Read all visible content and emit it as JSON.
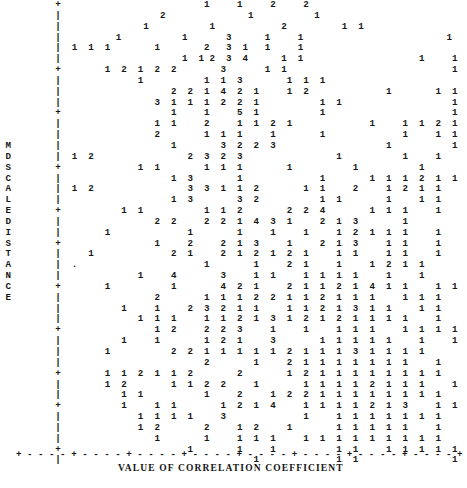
{
  "chart_data": {
    "type": "scatter",
    "title": "",
    "subtitle": "",
    "xlabel": "VALUE OF CORRELATION COEFFICIENT",
    "ylabel": "MDSCALE DISTANCE",
    "grid": false,
    "legend": null,
    "plot_style": "ascii-line-printer",
    "point_glyph_meaning": "digit = number of coincident observations in that character cell",
    "glyph_values_present": [
      "1",
      "2",
      "3",
      "4",
      "5"
    ],
    "axis_glyphs": {
      "y_axis_line": "|",
      "y_axis_tick": "+",
      "x_axis_line": "-",
      "x_axis_tick": "+",
      "origin": "+"
    },
    "x_tick_count": 9,
    "y_tick_count": 9,
    "relationship": "negative",
    "n_rows": 43,
    "n_cols": 62,
    "ylabel_letters_upper": [
      "M",
      "D",
      "S",
      "C",
      "A",
      "L",
      "E"
    ],
    "ylabel_letters_lower": [
      "D",
      "I",
      "S",
      "T",
      "A",
      "N",
      "C",
      "E"
    ],
    "rows": [
      "        +                          1     1     2     2                                         ",
      "        |                  2               1           1                                       ",
      "        |               1           1            2          1  1                               ",
      "        |          1           1       3      1     1                          1               ",
      "        |  1  1  1        1        2   3  1   1     1                                          ",
      "        |                      1  1 2  3  4      1  1                     1     1              ",
      "        +        1  2  1  2  2        3       1  1                              1              ",
      "        |              1           1  1  3        1  1  1                                      ",
      "        |                    2  2  1  4  2  1     1  2              1        1  1              ",
      "        |                 3  1  1  1  2  2  1           1  1                    1              ",
      "        +                    1     1     5  1           1                       1              ",
      "        |                 1  1     2     1  1  2  1              1     1  1  2  1              ",
      "        |                 2        1  1  1     1        1              1     1  1              ",
      "        |                    1        3  2  2  3                    1           1              ",
      "        |  1  2                 2  3  2  3                 1           1     1                 ",
      "        +              1  1        1  1  1        1           1           1                    ",
      "        |                    1  3        1              1        1  1  1  2  1  1              ",
      "        |  1  2                 3  3  1  1  2        1  1     2     1  2  1  1                 ",
      "        |                    1  3        3  2           1  1        1     1  1                 ",
      "        +           1  1           1  1  2        2  2  4        1  1  1     1                 ",
      "        |                 2  2     2  2  1  4  3  1     2  1  3        1                       ",
      "        |        1              1        1     1     1     1  2  1  1  1     1                 ",
      "        +                 1     2     2  1  3     1     2  1  3     1  1     1                 ",
      "        |     1              2  1     2  1  2  1  2  1     1  1     1  1     1                 ",
      "        |  .                       1        1     2  1     1     1  2  1  1                    ",
      "        |              1     4        3     1  1     1  1  1  1     1     1                    ",
      "        +        1           1        4  2  1     2  1  1  2  1  4  1  1     1  1              ",
      "        |                 2        1  1  1  2  2  1  1  2  1  1  1     1  1  1                 ",
      "        |           1     1     2  3  2  1  1     1  1  2  1  3  1  1     1  1                 ",
      "        |              1  1  1     1  1  2  1  3  1  2  1  2  1  1  1  1     1                 ",
      "        +                 1  2     2  2  3     1     1     1  1  1     1  1  1  1              ",
      "        |           1     1        1  2  1     3        1  1  1  1  1     1     1              ",
      "        |        1           2  2  1  1  1  1  1  2  1  1  1  3  1  1  1  1                    ",
      "        |                          2        1     2  1  1  1  1  1  1  1     1                 ",
      "        +        1  1  2  1  1  2        2        1  2  1  1  1  1  1  1  1  1                 ",
      "        |        1  2        1  1  2  2     1        1  1  1  1  2  1  1  1     1              ",
      "        |           1  1           1     2     1  2  2  1  1  1  1  1  1  1  1                 ",
      "        +           1     1  1        1  2  1  4     1  1  1  1  2  1  3     1  1              ",
      "        |              1  1  1  1     3              1     1  1  1  1  1  1  1                 ",
      "        |              1  2        2     1  2     1        1  1  1  1  1     1                 ",
      "        |                 1        1     1  1  1     1  1  1  1  1  1  1  1  1                 ",
      "        +                       1        1     1           1  1     1  1  1  1  1              ",
      "        |                                   1              1  1                 1              "
    ]
  }
}
